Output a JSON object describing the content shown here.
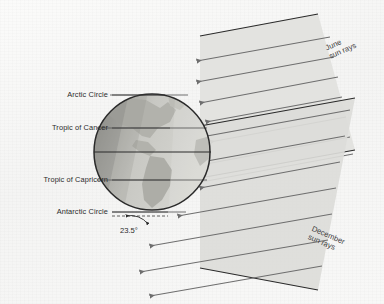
{
  "figure": {
    "background_color": "#f7f7f6"
  },
  "globe": {
    "name": "earth-globe",
    "center_x": 152,
    "center_y": 152,
    "radius": 58,
    "ocean_color": "#cfcfcb",
    "land_color": "#b0b0aa",
    "night_color": "#8f8f8a",
    "outline_color": "#2a2a2a"
  },
  "latitude_lines": [
    {
      "id": "arctic-circle",
      "label": "Arctic Circle",
      "y": 95,
      "label_x_right": 108,
      "leader_to_x": 188,
      "color": "#555555"
    },
    {
      "id": "tropic-of-cancer",
      "label": "Tropic of Cancer",
      "y": 128,
      "label_x_right": 108,
      "leader_to_x": 207,
      "color": "#555555"
    },
    {
      "id": "equator",
      "label": "",
      "y": 152,
      "label_x_right": 0,
      "leader_to_x": 211,
      "color": "#2a2a2a"
    },
    {
      "id": "tropic-of-capricorn",
      "label": "Tropic of Capricorn",
      "y": 180,
      "label_x_right": 108,
      "leader_to_x": 207,
      "color": "#555555"
    },
    {
      "id": "antarctic-circle",
      "label": "Antarctic Circle",
      "y": 212,
      "label_x_right": 108,
      "leader_to_x": 186,
      "color": "#555555"
    }
  ],
  "angle": {
    "name": "axial-tilt-angle",
    "value": "23.5°",
    "label_x": 122,
    "label_y": 228
  },
  "sun_ray_bands": [
    {
      "id": "june-sun-rays",
      "label_line1": "June",
      "label_line2": "sun rays",
      "label_x": 326,
      "label_y": 46,
      "label_rotation": -23.5,
      "band_color": "#e0e0dc",
      "ray_color": "#6e6e6e",
      "edge_color": "#2a2a2a",
      "ray_count": 7
    },
    {
      "id": "december-sun-rays",
      "label_line1": "December",
      "label_line2": "sun rays",
      "label_x": 318,
      "label_y": 228,
      "label_rotation": 23.5,
      "band_color": "#dddddb",
      "ray_color": "#6e6e6e",
      "edge_color": "#2a2a2a",
      "ray_count": 7
    }
  ]
}
